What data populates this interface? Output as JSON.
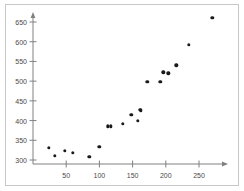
{
  "figure": {
    "width": 244,
    "height": 191,
    "background": "#ffffff",
    "frame_color": "#c8c8c8",
    "point_color": "#1a1a1a",
    "axis_color": "#808080",
    "label_color": "#4a4a4a"
  },
  "chart_data": {
    "type": "scatter",
    "title": "",
    "subtitle": "",
    "xlabel": "",
    "ylabel": "",
    "xlim": [
      0,
      285
    ],
    "ylim": [
      290,
      670
    ],
    "xticks": [
      50,
      100,
      150,
      200,
      250
    ],
    "yticks": [
      300,
      350,
      400,
      450,
      500,
      550,
      600,
      650
    ],
    "xtick_labels": [
      "50",
      "100",
      "150",
      "200",
      "250"
    ],
    "ytick_labels": [
      "300",
      "350",
      "400",
      "450",
      "500",
      "550",
      "600",
      "650"
    ],
    "grid": false,
    "legend": null,
    "legend_position": "none",
    "annotations": [],
    "x": [
      24,
      33,
      48,
      60,
      85,
      100,
      113,
      117,
      135,
      148,
      158,
      161,
      162,
      172,
      192,
      196,
      204,
      216,
      235,
      270
    ],
    "y": [
      331,
      311,
      324,
      319,
      308,
      334,
      385,
      385,
      392,
      414,
      400,
      427,
      426,
      499,
      499,
      522,
      520,
      540,
      592,
      661
    ],
    "points": [
      {
        "x": 24,
        "y": 331
      },
      {
        "x": 33,
        "y": 311
      },
      {
        "x": 48,
        "y": 324
      },
      {
        "x": 60,
        "y": 319
      },
      {
        "x": 85,
        "y": 308
      },
      {
        "x": 100,
        "y": 334
      },
      {
        "x": 113,
        "y": 385
      },
      {
        "x": 117,
        "y": 385
      },
      {
        "x": 135,
        "y": 392
      },
      {
        "x": 148,
        "y": 414
      },
      {
        "x": 158,
        "y": 400
      },
      {
        "x": 161,
        "y": 427
      },
      {
        "x": 162,
        "y": 426
      },
      {
        "x": 172,
        "y": 499
      },
      {
        "x": 192,
        "y": 499
      },
      {
        "x": 196,
        "y": 522
      },
      {
        "x": 204,
        "y": 520
      },
      {
        "x": 216,
        "y": 540
      },
      {
        "x": 235,
        "y": 592
      },
      {
        "x": 270,
        "y": 661
      }
    ]
  }
}
